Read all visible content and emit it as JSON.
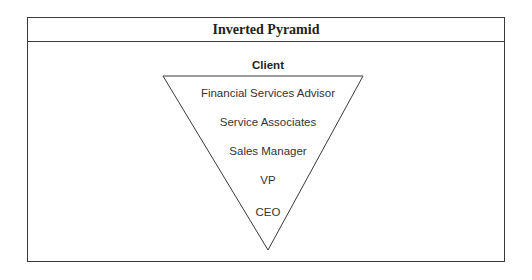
{
  "title": "Inverted Pyramid",
  "top_label": "Client",
  "levels": [
    {
      "label": "Financial Services Advisor"
    },
    {
      "label": "Service Associates"
    },
    {
      "label": "Sales Manager"
    },
    {
      "label": "VP"
    },
    {
      "label": "CEO"
    }
  ],
  "colors": {
    "stroke": "#3a3a3a",
    "text": "#333333",
    "background": "#ffffff"
  }
}
